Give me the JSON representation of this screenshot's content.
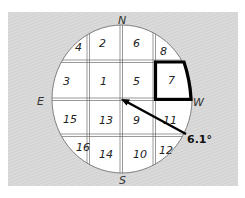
{
  "diagram": {
    "type": "sky-grid-compass",
    "colors": {
      "background": "#d8d8d8",
      "hatch": "#cfcfcf",
      "circle_fill": "#ffffff",
      "grid_line": "#555555",
      "highlight": "#000000",
      "arrow": "#000000"
    },
    "directions": {
      "north": "N",
      "south": "S",
      "east": "E",
      "west": "W"
    },
    "cells": [
      {
        "id": "4",
        "label": "4"
      },
      {
        "id": "2",
        "label": "2"
      },
      {
        "id": "6",
        "label": "6"
      },
      {
        "id": "8",
        "label": "8"
      },
      {
        "id": "3",
        "label": "3"
      },
      {
        "id": "1",
        "label": "1"
      },
      {
        "id": "5",
        "label": "5"
      },
      {
        "id": "7",
        "label": "7"
      },
      {
        "id": "15",
        "label": "15"
      },
      {
        "id": "13",
        "label": "13"
      },
      {
        "id": "9",
        "label": "9"
      },
      {
        "id": "11",
        "label": "11"
      },
      {
        "id": "16",
        "label": "16"
      },
      {
        "id": "14",
        "label": "14"
      },
      {
        "id": "10",
        "label": "10"
      },
      {
        "id": "12",
        "label": "12"
      }
    ],
    "highlighted_cell": "7",
    "arrow": {
      "label": "6.1°"
    }
  }
}
